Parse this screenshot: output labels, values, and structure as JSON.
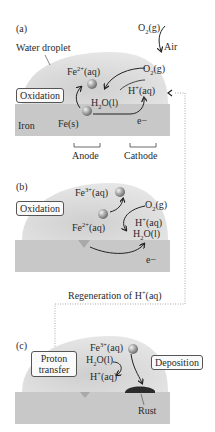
{
  "panels": [
    {
      "label": "(a)",
      "droplet_label": "Water droplet",
      "air_label": "Air",
      "o2_air": "O2(g)",
      "o2_dissolved": "O2(g)",
      "fe2": "Fe2+(aq)",
      "h2o": "H2O(l)",
      "hplus": "H+(aq)",
      "fe_solid": "Fe(s)",
      "electron": "e−",
      "metal_label": "Iron",
      "process_box": "Oxidation",
      "anode_label": "Anode",
      "cathode_label": "Cathode"
    },
    {
      "label": "(b)",
      "fe3": "Fe3+(aq)",
      "fe2": "Fe2+(aq)",
      "o2": "O2(g)",
      "hplus": "H+(aq)",
      "h2o": "H2O(l)",
      "electron": "e−",
      "process_box": "Oxidation"
    },
    {
      "label": "(c)",
      "fe3": "Fe3+(aq)",
      "h2o": "H2O(l)",
      "hplus": "H+(aq)",
      "rust_label": "Rust",
      "process_box_left": "Proton transfer",
      "process_box_right": "Deposition"
    }
  ],
  "regeneration_label": "Regeneration of H+(aq)",
  "colors": {
    "droplet": "#d9d9d9",
    "metal": "#c8c8c8",
    "ion_sphere": "#9a9a9a",
    "rust": "#2b2b2b",
    "dotted_line": "#aaaaaa"
  }
}
